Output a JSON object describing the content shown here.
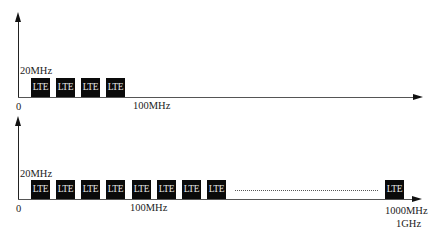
{
  "panels": [
    {
      "id": "top",
      "bandwidth_label": "20MHz",
      "origin_label": "0",
      "tick_labels": [
        "100MHz"
      ],
      "carriers": [
        "LTE",
        "LTE",
        "LTE",
        "LTE"
      ]
    },
    {
      "id": "bottom",
      "bandwidth_label": "20MHz",
      "origin_label": "0",
      "tick_labels": [
        "100MHz",
        "1000MHz",
        "1GHz"
      ],
      "carriers": [
        "LTE",
        "LTE",
        "LTE",
        "LTE",
        "LTE",
        "LTE",
        "LTE",
        "LTE"
      ],
      "ellipsis": "dotted-line",
      "last_carrier": "LTE"
    }
  ],
  "colors": {
    "carrier_fill": "#0a0a0a",
    "carrier_text": "#e6e6e6",
    "axis": "#222222"
  }
}
